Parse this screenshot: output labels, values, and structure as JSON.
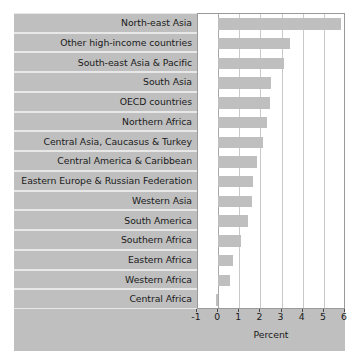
{
  "chart_data": {
    "type": "bar",
    "orientation": "horizontal",
    "title": "",
    "subtitle": "",
    "xlabel": "Percent",
    "ylabel": "",
    "xlim": [
      -1,
      6
    ],
    "xticks": [
      -1,
      0,
      1,
      2,
      3,
      4,
      5,
      6
    ],
    "xtick_labels": [
      "-1",
      "0",
      "1",
      "2",
      "3",
      "4",
      "5",
      "6"
    ],
    "grid": true,
    "legend": null,
    "bar_color": "#bfbfbf",
    "panel_color": "#bfbfbf",
    "plot_background": "#ffffff",
    "categories": [
      "North-east Asia",
      "Other high-income countries",
      "South-east Asia & Pacific",
      "South Asia",
      "OECD countries",
      "Northern Africa",
      "Central Asia, Caucasus & Turkey",
      "Central America & Caribbean",
      "Eastern Europe & Russian Federation",
      "Western Asia",
      "South America",
      "Southern Africa",
      "Eastern Africa",
      "Western Africa",
      "Central Africa"
    ],
    "values": [
      5.8,
      3.4,
      3.1,
      2.5,
      2.45,
      2.3,
      2.1,
      1.85,
      1.65,
      1.6,
      1.4,
      1.1,
      0.7,
      0.55,
      -0.1
    ]
  }
}
